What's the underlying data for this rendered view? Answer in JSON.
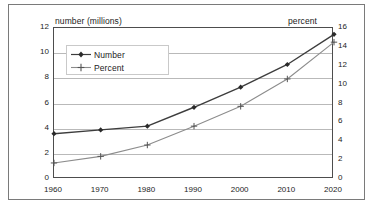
{
  "figure": {
    "left_axis_title": "number (millions)",
    "right_axis_title": "percent"
  },
  "legend": {
    "position": "inside-top-left",
    "entries": [
      {
        "label": "Number",
        "marker": "diamond-marker-icon",
        "color": "#3d3d3d"
      },
      {
        "label": "Percent",
        "marker": "plus-marker-icon",
        "color": "#8c8c8c"
      }
    ]
  },
  "axes": {
    "left_ticks": [
      "12",
      "10",
      "8",
      "6",
      "4",
      "2",
      "0"
    ],
    "right_ticks": [
      "16",
      "14",
      "12",
      "10",
      "8",
      "6",
      "4",
      "2",
      "0"
    ],
    "x_ticks": [
      "1960",
      "1970",
      "1980",
      "1990",
      "2000",
      "2010",
      "2020"
    ]
  },
  "chart_data": {
    "type": "line",
    "title": "",
    "subtitle": "",
    "xlabel": "",
    "ylabel": "number (millions)",
    "y2label": "percent",
    "x": [
      1960,
      1970,
      1980,
      1990,
      2000,
      2010,
      2020
    ],
    "xlim": [
      1960,
      2020
    ],
    "ylim": [
      0,
      12
    ],
    "y2lim": [
      0,
      16
    ],
    "grid": true,
    "legend_position": "upper left (inset)",
    "series": [
      {
        "name": "Number",
        "axis": "left",
        "units": "millions",
        "color": "#3d3d3d",
        "marker": "diamond",
        "values": [
          3.6,
          3.9,
          4.2,
          5.7,
          7.3,
          9.1,
          11.5
        ]
      },
      {
        "name": "Percent",
        "axis": "right",
        "units": "percent",
        "color": "#8c8c8c",
        "marker": "plus",
        "values": [
          1.7,
          2.4,
          3.6,
          5.6,
          7.7,
          10.6,
          14.5
        ]
      }
    ]
  },
  "colors": {
    "background": "#ffffff",
    "frame": "#7a7a7a",
    "plot_border": "#4d4d4d",
    "gridline": "#b9b9b9",
    "text": "#1c1c1c",
    "series_number": "#3d3d3d",
    "series_percent": "#8c8c8c"
  }
}
